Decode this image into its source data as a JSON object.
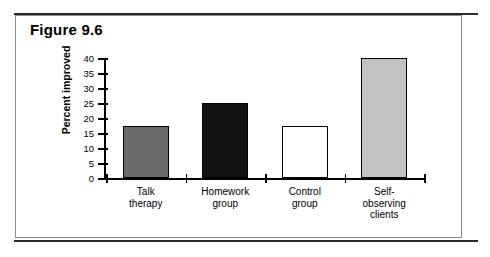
{
  "figure": {
    "title": "Figure 9.6"
  },
  "chart_data": {
    "type": "bar",
    "title": "Figure 9.6",
    "xlabel": "",
    "ylabel": "Percent improved",
    "ylim": [
      0,
      40
    ],
    "ytick_step": 5,
    "yticks": [
      0,
      5,
      10,
      15,
      20,
      25,
      30,
      35,
      40
    ],
    "ytick_labels": [
      "0",
      "5",
      "10",
      "15",
      "20",
      "25",
      "30",
      "35",
      "40"
    ],
    "grid": false,
    "legend": false,
    "categories": [
      "Talk therapy",
      "Homework group",
      "Control group",
      "Self-observing clients"
    ],
    "category_label_lines": [
      [
        "Talk",
        "therapy"
      ],
      [
        "Homework",
        "group"
      ],
      [
        "Control",
        "group"
      ],
      [
        "Self-",
        "observing",
        "clients"
      ]
    ],
    "values": [
      17.5,
      25,
      17.5,
      40
    ],
    "bar_colors": [
      "#6a6a6a",
      "#121212",
      "#ffffff",
      "#c2c2c2"
    ],
    "bar_edge_color": "#000000"
  },
  "colors": {
    "rule": "#2b2b2b",
    "box_border": "#8d8d8d",
    "axis": "#000000",
    "text": "#000000",
    "background": "#ffffff"
  }
}
